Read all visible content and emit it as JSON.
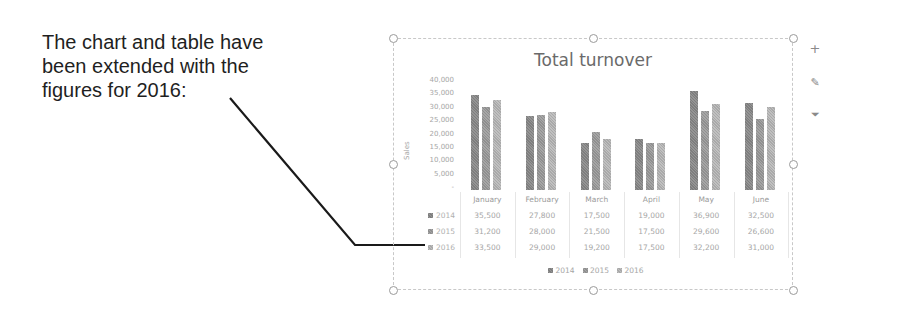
{
  "annotation": {
    "lines": [
      "The chart and table have",
      "been extended with the",
      "figures for 2016:"
    ]
  },
  "chart_data": {
    "type": "bar",
    "title": "Total turnover",
    "xlabel": "",
    "ylabel": "Sales",
    "ylim": [
      0,
      40000
    ],
    "yticks": [
      "40,000",
      "35,000",
      "30,000",
      "25,000",
      "20,000",
      "15,000",
      "10,000",
      "5,000",
      "-"
    ],
    "categories": [
      "January",
      "February",
      "March",
      "April",
      "May",
      "June"
    ],
    "series": [
      {
        "name": "2014",
        "values": [
          35500,
          27800,
          17500,
          19000,
          36900,
          32500
        ],
        "display": [
          "35,500",
          "27,800",
          "17,500",
          "19,000",
          "36,900",
          "32,500"
        ],
        "color": "#8a8a8a"
      },
      {
        "name": "2015",
        "values": [
          31200,
          28000,
          21500,
          17500,
          29600,
          26600
        ],
        "display": [
          "31,200",
          "28,000",
          "21,500",
          "17,500",
          "29,600",
          "26,600"
        ],
        "color": "#9c9c9c"
      },
      {
        "name": "2016",
        "values": [
          33500,
          29000,
          19200,
          17500,
          32200,
          31000
        ],
        "display": [
          "33,500",
          "29,000",
          "19,200",
          "17,500",
          "32,200",
          "31,000"
        ],
        "color": "#b5b5b5"
      }
    ],
    "data_table": true,
    "grid": false,
    "legend_position": "bottom"
  },
  "side_buttons": [
    {
      "name": "chart-elements",
      "glyph": "+"
    },
    {
      "name": "chart-styles",
      "glyph": "✎"
    },
    {
      "name": "chart-filters",
      "glyph": "⏷"
    }
  ]
}
